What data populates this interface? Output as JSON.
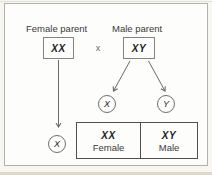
{
  "diagram": {
    "title_hint": "sex-determination-cross",
    "female_parent": {
      "label": "Female parent",
      "genotype": "XX"
    },
    "male_parent": {
      "label": "Male parent",
      "genotype": "XY"
    },
    "cross_symbol": "x",
    "gametes": {
      "female_x": "X",
      "male_x": "X",
      "male_y": "Y"
    },
    "offspring": [
      {
        "genotype": "XX",
        "sex": "Female"
      },
      {
        "genotype": "XY",
        "sex": "Male"
      }
    ]
  },
  "colors": {
    "page_background": "#f8f6f1",
    "panel_background": "#fdfdfb",
    "frame_border": "#b3b1ac",
    "box_border": "#828282",
    "table_border": "#4f4f4f",
    "arrow_line": "#6a6a6a",
    "text": "#3a3a3a",
    "genotype_text": "#1e1e1e",
    "bottom_strip": "#ddd8cb"
  }
}
